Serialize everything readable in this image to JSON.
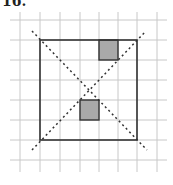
{
  "problem_label": "16.",
  "figure": {
    "grid": {
      "x_lines": [
        20,
        40,
        60,
        80,
        99,
        118,
        137,
        157
      ],
      "y_lines": [
        20,
        40,
        60,
        80,
        100,
        120,
        140,
        160
      ],
      "color": "#c8c8c8"
    },
    "square": {
      "x": 40,
      "y": 40,
      "width": 97,
      "height": 100,
      "stroke": "#333333"
    },
    "shaded_cells": [
      {
        "x": 99,
        "y": 40,
        "width": 19,
        "height": 20
      },
      {
        "x": 80,
        "y": 100,
        "width": 19,
        "height": 20
      }
    ],
    "shade_color": "#a9a9a9",
    "diagonals": [
      {
        "x1": 32,
        "y1": 31,
        "x2": 147,
        "y2": 150
      },
      {
        "x1": 32,
        "y1": 150,
        "x2": 146,
        "y2": 31
      }
    ]
  }
}
